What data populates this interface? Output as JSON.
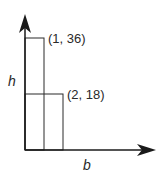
{
  "diagram": {
    "axes": {
      "x_label": "b",
      "y_label": "h"
    },
    "rectangles": [
      {
        "label": "(1, 36)",
        "base": 1,
        "height": 36
      },
      {
        "label": "(2, 18)",
        "base": 2,
        "height": 18
      }
    ],
    "colors": {
      "line": "#2a2a2a",
      "background": "#ffffff"
    }
  }
}
